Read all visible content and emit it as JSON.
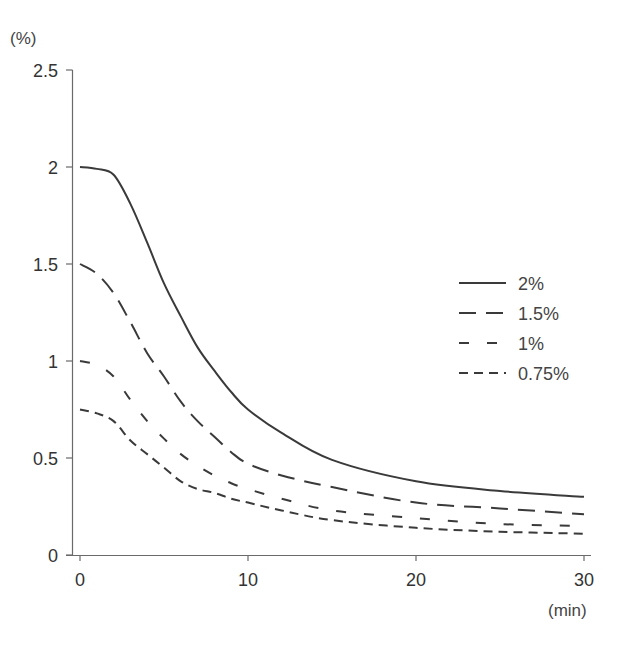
{
  "chart_data": {
    "type": "line",
    "title": "",
    "xlabel": "(min)",
    "ylabel": "(%)",
    "xlim": [
      0,
      30
    ],
    "ylim": [
      0,
      2.5
    ],
    "x_ticks": [
      0,
      10,
      20,
      30
    ],
    "y_ticks": [
      0,
      0.5,
      1,
      1.5,
      2,
      2.5
    ],
    "y_tick_labels": [
      "0",
      "0.5",
      "1",
      "1.5",
      "2",
      "2.5"
    ],
    "x_tick_labels": [
      "0",
      "10",
      "20",
      "30"
    ],
    "grid": false,
    "legend_position": "right-middle",
    "x": [
      0,
      1,
      2,
      3,
      4,
      5,
      6,
      7,
      8,
      9,
      10,
      12,
      15,
      20,
      25,
      30
    ],
    "series": [
      {
        "name": "2%",
        "style": "solid",
        "values": [
          2.0,
          1.99,
          1.96,
          1.81,
          1.61,
          1.4,
          1.23,
          1.07,
          0.95,
          0.84,
          0.75,
          0.63,
          0.49,
          0.38,
          0.33,
          0.3
        ]
      },
      {
        "name": "1.5%",
        "style": "long-dash",
        "values": [
          1.5,
          1.45,
          1.35,
          1.2,
          1.04,
          0.92,
          0.79,
          0.69,
          0.61,
          0.53,
          0.47,
          0.41,
          0.35,
          0.27,
          0.24,
          0.21
        ]
      },
      {
        "name": "1%",
        "style": "medium-dash",
        "values": [
          1.0,
          0.98,
          0.92,
          0.8,
          0.69,
          0.6,
          0.52,
          0.46,
          0.41,
          0.37,
          0.34,
          0.29,
          0.23,
          0.19,
          0.16,
          0.15
        ]
      },
      {
        "name": "0.75%",
        "style": "short-dash",
        "values": [
          0.75,
          0.73,
          0.69,
          0.59,
          0.52,
          0.45,
          0.38,
          0.34,
          0.32,
          0.29,
          0.27,
          0.23,
          0.18,
          0.14,
          0.12,
          0.11
        ]
      }
    ]
  },
  "axes": {
    "y_unit": "(%)",
    "x_unit": "(min)"
  },
  "legend": {
    "items": [
      {
        "label": "2%"
      },
      {
        "label": "1.5%"
      },
      {
        "label": "1%"
      },
      {
        "label": "0.75%"
      }
    ]
  },
  "colors": {
    "line": "#3a3a3a",
    "axis": "#666666",
    "text": "#333333"
  }
}
